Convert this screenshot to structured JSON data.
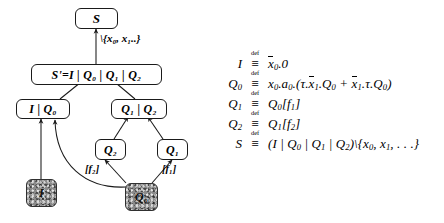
{
  "figure": {
    "diagram": {
      "nodes": [
        {
          "id": "S",
          "label": "S",
          "shaded": false
        },
        {
          "id": "Sprime",
          "label": "S'=I | Q₀ | Q₁ | Q₂",
          "shaded": false
        },
        {
          "id": "IQ0",
          "label": "I | Q₀",
          "shaded": false
        },
        {
          "id": "Q1Q2",
          "label": "Q₁ | Q₂",
          "shaded": false
        },
        {
          "id": "Q2",
          "label": "Q₂",
          "shaded": false
        },
        {
          "id": "Q1",
          "label": "Q₁",
          "shaded": false
        },
        {
          "id": "I",
          "label": "I",
          "shaded": true
        },
        {
          "id": "Q0",
          "label": "Q₀",
          "shaded": true
        }
      ],
      "edge_labels": [
        {
          "id": "restriction",
          "text": "\\{x₀, x₁..}"
        },
        {
          "id": "relabel-f2",
          "text": "[f₂]"
        },
        {
          "id": "relabel-f1",
          "text": "[f₁]"
        }
      ]
    },
    "equations": [
      {
        "lhs": "I",
        "def": "def",
        "rhs_html": "<span class=\"ovl\">x</span><span class=\"sub\">0</span>.0"
      },
      {
        "lhs": "Q",
        "lhs_sub": "0",
        "def": "def",
        "rhs_html": "x<span class=\"sub\">0</span>.a<span class=\"sub\">0</span>.(&tau;.<span class=\"ovl\">x</span><span class=\"sub\">1</span>.Q<span class=\"sub\">0</span> + <span class=\"ovl\">x</span><span class=\"sub\">1</span>.&tau;.Q<span class=\"sub\">0</span>)"
      },
      {
        "lhs": "Q",
        "lhs_sub": "1",
        "def": "def",
        "rhs_html": "Q<span class=\"sub\">0</span>[f<span class=\"sub\">1</span>]"
      },
      {
        "lhs": "Q",
        "lhs_sub": "2",
        "def": "def",
        "rhs_html": "Q<span class=\"sub\">1</span>[f<span class=\"sub\">2</span>]"
      },
      {
        "lhs": "S",
        "def": "def",
        "rhs_html": "(I | Q<span class=\"sub\">0</span> | Q<span class=\"sub\">1</span> | Q<span class=\"sub\">2</span>)\\{x<span class=\"sub\">0</span>, x<span class=\"sub\">1</span>, . . .}"
      }
    ],
    "equations_plain": [
      "I ≝ x̄₀.0",
      "Q₀ ≝ x₀.a₀.(τ.x̄₁.Q₀ + x̄₁.τ.Q₀)",
      "Q₁ ≝ Q₀[f₁]",
      "Q₂ ≝ Q₁[f₂]",
      "S ≝ (I | Q₀ | Q₁ | Q₂)\\{x₀, x₁, . . .}"
    ],
    "colors": {
      "stroke": "#1a1a1a",
      "node_fill": "#ffffff",
      "shaded_fill": "#8a8a8a",
      "background": "#ffffff"
    }
  }
}
